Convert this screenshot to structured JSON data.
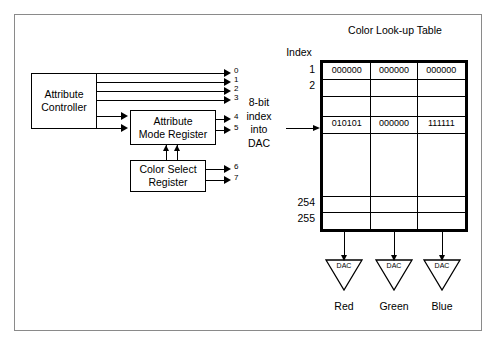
{
  "diagram": {
    "title_lut": "Color Look-up Table",
    "index_header": "Index",
    "blocks": {
      "attribute_controller": {
        "line1": "Attribute",
        "line2": "Controller"
      },
      "attribute_mode_register": {
        "line1": "Attribute",
        "line2": "Mode Register"
      },
      "color_select_register": {
        "line1": "Color Select",
        "line2": "Register"
      }
    },
    "bit_labels": [
      "0",
      "1",
      "2",
      "3",
      "4",
      "5",
      "6",
      "7"
    ],
    "bus_caption": {
      "l1": "8-bit",
      "l2": "index",
      "l3": "into",
      "l4": "DAC"
    },
    "index_labels": {
      "first": "1",
      "second": "2",
      "second_last": "254",
      "last": "255"
    },
    "lut_rows": [
      {
        "index": "1",
        "cells": [
          "000000",
          "000000",
          "000000"
        ]
      },
      {
        "index": "2",
        "cells": [
          "",
          "",
          ""
        ]
      },
      {
        "index": "",
        "cells": [
          "",
          "",
          ""
        ]
      },
      {
        "index": "",
        "cells": [
          "010101",
          "000000",
          "111111"
        ]
      },
      {
        "index": "",
        "cells": [
          "",
          "",
          ""
        ]
      },
      {
        "index": "254",
        "cells": [
          "",
          "",
          ""
        ]
      },
      {
        "index": "255",
        "cells": [
          "",
          "",
          ""
        ]
      }
    ],
    "dacs": [
      {
        "tag": "DAC",
        "channel": "Red"
      },
      {
        "tag": "DAC",
        "channel": "Green"
      },
      {
        "tag": "DAC",
        "channel": "Blue"
      }
    ],
    "colors": {
      "line": "#000000",
      "frame": "#8a8a8a",
      "background": "#ffffff"
    }
  }
}
